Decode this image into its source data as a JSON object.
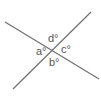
{
  "diagram": {
    "type": "intersecting-lines-angles",
    "line_color": "#707070",
    "label_color": "#555555",
    "lines": [
      {
        "id": "line-1",
        "x1": 5,
        "y1": 22,
        "x2": 99,
        "y2": 79
      },
      {
        "id": "line-2",
        "x1": 13,
        "y1": 89,
        "x2": 91,
        "y2": 12
      }
    ],
    "intersection": {
      "x": 53,
      "y": 50
    },
    "angles": [
      {
        "id": "a",
        "label": "a°",
        "position": "left",
        "x": 36,
        "y": 46
      },
      {
        "id": "b",
        "label": "b°",
        "position": "bottom",
        "x": 49,
        "y": 57
      },
      {
        "id": "c",
        "label": "c°",
        "position": "right",
        "x": 61,
        "y": 44
      },
      {
        "id": "d",
        "label": "d°",
        "position": "top",
        "x": 48,
        "y": 33
      }
    ]
  }
}
